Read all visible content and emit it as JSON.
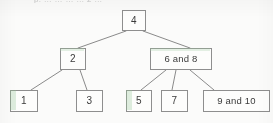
{
  "figure": {
    "type": "tree-diagram",
    "cropped_heading": "p. … … … … 2 …",
    "background_color": "#fbfbfa",
    "box_border_color": "#8e8e8e",
    "box_fill_color": "#fdfdfc",
    "edge_color": "#7d7d7d",
    "text_color": "#3b3b3b"
  },
  "nodes": [
    {
      "id": "root",
      "label": "4",
      "x": 122,
      "y": 10,
      "w": 24,
      "h": 21
    },
    {
      "id": "n2",
      "label": "2",
      "x": 60,
      "y": 48,
      "w": 26,
      "h": 22
    },
    {
      "id": "n68",
      "label": "6 and 8",
      "x": 150,
      "y": 48,
      "w": 62,
      "h": 22
    },
    {
      "id": "n1",
      "label": "1",
      "x": 10,
      "y": 90,
      "w": 28,
      "h": 22
    },
    {
      "id": "n3",
      "label": "3",
      "x": 76,
      "y": 90,
      "w": 27,
      "h": 22
    },
    {
      "id": "n5",
      "label": "5",
      "x": 126,
      "y": 90,
      "w": 26,
      "h": 22
    },
    {
      "id": "n7",
      "label": "7",
      "x": 161,
      "y": 90,
      "w": 27,
      "h": 22
    },
    {
      "id": "n910",
      "label": "9 and 10",
      "x": 203,
      "y": 90,
      "w": 67,
      "h": 22
    }
  ],
  "edges": [
    {
      "from": "root",
      "to": "n2",
      "x1": 126,
      "y1": 31,
      "x2": 78,
      "y2": 48
    },
    {
      "from": "root",
      "to": "n68",
      "x1": 143,
      "y1": 31,
      "x2": 190,
      "y2": 48
    },
    {
      "from": "n2",
      "to": "n1",
      "x1": 62,
      "y1": 70,
      "x2": 31,
      "y2": 90
    },
    {
      "from": "n2",
      "to": "n3",
      "x1": 80,
      "y1": 70,
      "x2": 87,
      "y2": 90
    },
    {
      "from": "n68",
      "to": "n5",
      "x1": 166,
      "y1": 70,
      "x2": 141,
      "y2": 90
    },
    {
      "from": "n68",
      "to": "n7",
      "x1": 176,
      "y1": 70,
      "x2": 172,
      "y2": 90
    },
    {
      "from": "n68",
      "to": "n910",
      "x1": 190,
      "y1": 70,
      "x2": 214,
      "y2": 90
    }
  ]
}
